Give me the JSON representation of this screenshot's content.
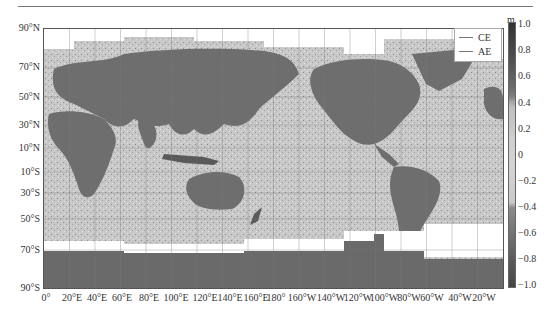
{
  "figure": {
    "legend": {
      "items": [
        {
          "label": "CE",
          "line_color": "#888888"
        },
        {
          "label": "AE",
          "line_color": "#666666"
        }
      ]
    },
    "y_axis": {
      "ticks": [
        "90°N",
        "70°N",
        "50°N",
        "30°N",
        "10°N",
        "10°S",
        "30°S",
        "50°S",
        "70°S",
        "90°S"
      ]
    },
    "x_axis": {
      "ticks": [
        "0°",
        "20°E",
        "40°E",
        "60°E",
        "80°E",
        "100°E",
        "120°E",
        "140°E",
        "160°E",
        "180°",
        "160°W",
        "140°W",
        "120°W",
        "100°W",
        "80°W",
        "60°W",
        "40°W",
        "20°W"
      ]
    },
    "colorbar": {
      "unit": "m",
      "ticks": [
        "1.0",
        "0.8",
        "0.6",
        "0.4",
        "0.2",
        "0",
        "−0.2",
        "−0.4",
        "−0.6",
        "−0.8",
        "−1.0"
      ],
      "range": [
        -1.0,
        1.0
      ]
    },
    "colors": {
      "land": "#6e6e6e",
      "ocean": "#c6c6c6",
      "ice_gap": "#ffffff",
      "antarctica": "#6a6a6a"
    }
  }
}
